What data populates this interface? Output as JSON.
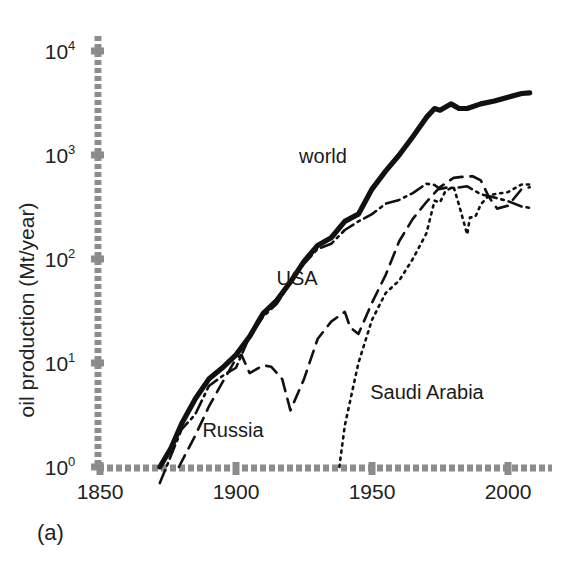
{
  "figure": {
    "panel_caption": "(a)",
    "ylabel": "oil production (Mt/year)"
  },
  "axes": {
    "x_ticks": [
      "1850",
      "1900",
      "1950",
      "2000"
    ],
    "y_ticks": [
      {
        "base": "10",
        "exp": "0"
      },
      {
        "base": "10",
        "exp": "1"
      },
      {
        "base": "10",
        "exp": "2"
      },
      {
        "base": "10",
        "exp": "3"
      },
      {
        "base": "10",
        "exp": "4"
      }
    ]
  },
  "series_labels": {
    "world": "world",
    "usa": "USA",
    "russia": "Russia",
    "saudi": "Saudi Arabia"
  },
  "chart_data": {
    "type": "line",
    "title": "",
    "subtitle": "",
    "panel": "(a)",
    "xlabel": "",
    "ylabel": "oil production (Mt/year)",
    "yscale": "log",
    "xscale": "linear",
    "xlim": [
      1850,
      2010
    ],
    "ylim": [
      1,
      20000
    ],
    "xticks": [
      1850,
      1900,
      1950,
      2000
    ],
    "yticks": [
      1,
      10,
      100,
      1000,
      10000
    ],
    "ytick_labels": [
      "10^0",
      "10^1",
      "10^2",
      "10^3",
      "10^4"
    ],
    "grid": false,
    "legend": "inline-annotations",
    "annotations": [
      {
        "text": "world",
        "x": 1955,
        "y": 1200
      },
      {
        "text": "USA",
        "x": 1945,
        "y": 105
      },
      {
        "text": "Russia",
        "x": 1898,
        "y": 4.2
      },
      {
        "text": "Saudi Arabia",
        "x": 1955,
        "y": 6.3
      }
    ],
    "series": [
      {
        "name": "world",
        "style": "solid",
        "color": "#111111",
        "x": [
          1872,
          1876,
          1880,
          1885,
          1890,
          1895,
          1900,
          1905,
          1910,
          1915,
          1920,
          1925,
          1930,
          1935,
          1940,
          1945,
          1950,
          1955,
          1960,
          1965,
          1970,
          1973,
          1975,
          1979,
          1980,
          1982,
          1985,
          1990,
          1995,
          2000,
          2005,
          2008
        ],
        "y": [
          1.0,
          1.5,
          2.6,
          4.5,
          7.0,
          9.0,
          12.0,
          18.0,
          30.0,
          40.0,
          60.0,
          95.0,
          135.0,
          160.0,
          230.0,
          270.0,
          470.0,
          700.0,
          1000.0,
          1500.0,
          2300.0,
          2800.0,
          2700.0,
          3100.0,
          3000.0,
          2800.0,
          2800.0,
          3100.0,
          3300.0,
          3600.0,
          3900.0,
          3950.0
        ]
      },
      {
        "name": "USA",
        "style": "dash-dot",
        "color": "#111111",
        "x": [
          1872,
          1880,
          1885,
          1890,
          1895,
          1900,
          1905,
          1910,
          1915,
          1920,
          1925,
          1930,
          1935,
          1940,
          1945,
          1950,
          1955,
          1960,
          1965,
          1970,
          1973,
          1975,
          1978,
          1980,
          1985,
          1990,
          1995,
          2000,
          2005,
          2008
        ],
        "y": [
          0.7,
          2.3,
          3.2,
          6.0,
          7.5,
          9.0,
          18.0,
          28.0,
          37.0,
          60.0,
          90.0,
          125.0,
          140.0,
          190.0,
          230.0,
          270.0,
          340.0,
          370.0,
          430.0,
          530.0,
          515.0,
          470.0,
          490.0,
          480.0,
          500.0,
          420.0,
          390.0,
          360.0,
          320.0,
          310.0
        ]
      },
      {
        "name": "Russia",
        "style": "dashed",
        "color": "#111111",
        "x": [
          1879,
          1885,
          1890,
          1895,
          1900,
          1902,
          1905,
          1910,
          1913,
          1917,
          1920,
          1925,
          1930,
          1935,
          1940,
          1942,
          1945,
          1950,
          1955,
          1960,
          1965,
          1970,
          1975,
          1980,
          1983,
          1987,
          1990,
          1993,
          1996,
          2000,
          2005,
          2008
        ],
        "y": [
          1.0,
          2.0,
          3.8,
          6.5,
          11.0,
          12.0,
          8.0,
          9.5,
          9.2,
          7.0,
          3.5,
          7.0,
          17.0,
          25.0,
          31.0,
          22.0,
          19.0,
          38.0,
          70.0,
          148.0,
          243.0,
          353.0,
          491.0,
          603.0,
          616.0,
          625.0,
          570.0,
          395.0,
          305.0,
          325.0,
          470.0,
          490.0
        ]
      },
      {
        "name": "Saudi Arabia",
        "style": "dotted",
        "color": "#111111",
        "x": [
          1938,
          1940,
          1945,
          1950,
          1955,
          1960,
          1965,
          1970,
          1973,
          1975,
          1977,
          1980,
          1982,
          1985,
          1986,
          1988,
          1990,
          1993,
          1995,
          2000,
          2005,
          2008
        ],
        "y": [
          1.0,
          2.5,
          10.0,
          26.0,
          47.0,
          62.0,
          100.0,
          176.0,
          364.0,
          350.0,
          450.0,
          496.0,
          330.0,
          172.0,
          250.0,
          255.0,
          335.0,
          410.0,
          420.0,
          440.0,
          520.0,
          520.0
        ]
      }
    ]
  }
}
